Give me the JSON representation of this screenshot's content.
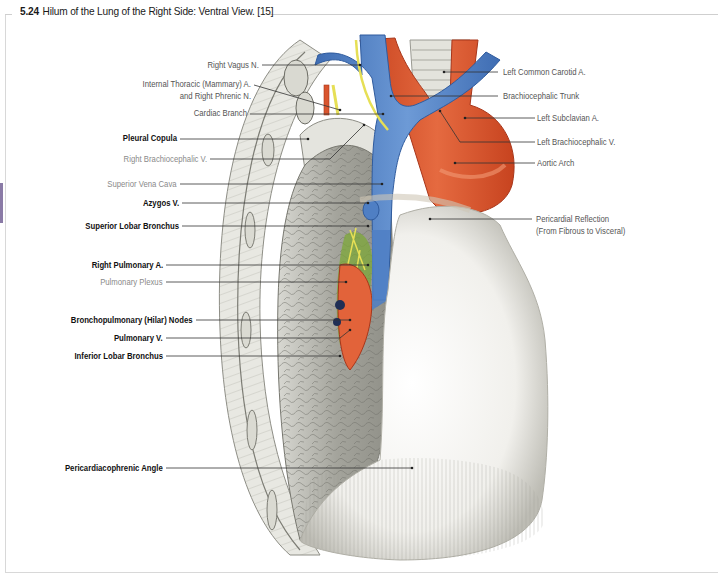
{
  "figure": {
    "number": "5.24",
    "title": "Hilum of the Lung of the Right Side: Ventral View. [15]",
    "accent_tab_color": "#8a7aa6"
  },
  "colors": {
    "artery": "#d9552e",
    "vein": "#4f7fc4",
    "nerve": "#e6df55",
    "lymph_node": "#7ba832",
    "pericardium": "#f1f0ec",
    "lung": "#a8a8a0",
    "leader_line": "#333333"
  },
  "labels_left": [
    {
      "text": "Right Vagus N.",
      "style": "normal"
    },
    {
      "text": "Internal Thoracic (Mammary) A.",
      "style": "normal"
    },
    {
      "text": "and Right Phrenic N.",
      "style": "normal"
    },
    {
      "text": "Cardiac Branch",
      "style": "normal"
    },
    {
      "text": "Pleural Copula",
      "style": "bold"
    },
    {
      "text": "Right  Brachiocephalic V.",
      "style": "light"
    },
    {
      "text": "Superior Vena Cava",
      "style": "light"
    },
    {
      "text": "Azygos V.",
      "style": "bold"
    },
    {
      "text": "Superior Lobar Bronchus",
      "style": "bold"
    },
    {
      "text": "Right Pulmonary A.",
      "style": "bold"
    },
    {
      "text": "Pulmonary Plexus",
      "style": "light"
    },
    {
      "text": "Bronchopulmonary (Hilar) Nodes",
      "style": "bold"
    },
    {
      "text": "Pulmonary V.",
      "style": "bold"
    },
    {
      "text": "Inferior Lobar Bronchus",
      "style": "bold"
    },
    {
      "text": "Pericardiacophrenic Angle",
      "style": "bold"
    }
  ],
  "labels_right": [
    {
      "text": "Left Common Carotid A.",
      "style": "normal"
    },
    {
      "text": "Brachiocephalic Trunk",
      "style": "normal"
    },
    {
      "text": "Left Subclavian A.",
      "style": "normal"
    },
    {
      "text": "Left Brachiocephalic V.",
      "style": "normal"
    },
    {
      "text": "Aortic Arch",
      "style": "normal"
    },
    {
      "text": "Pericardial Reflection",
      "style": "normal"
    },
    {
      "text": "(From Fibrous to Visceral)",
      "style": "normal"
    }
  ]
}
